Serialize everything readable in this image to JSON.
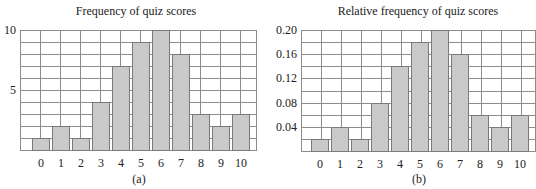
{
  "chart_data": [
    {
      "type": "bar",
      "title": "Frequency of quiz scores",
      "caption": "(a)",
      "xlabel": "",
      "ylabel": "",
      "categories": [
        "0",
        "1",
        "2",
        "3",
        "4",
        "5",
        "6",
        "7",
        "8",
        "9",
        "10"
      ],
      "values": [
        1,
        2,
        1,
        4,
        7,
        9,
        10,
        8,
        3,
        2,
        3
      ],
      "ylim": [
        0,
        10
      ],
      "yticks": [
        5,
        10
      ],
      "ytick_labels": [
        "5",
        "10"
      ],
      "grid_step": 1,
      "grid": true,
      "bar_color": "#c9c9c9"
    },
    {
      "type": "bar",
      "title": "Relative frequency of quiz scores",
      "caption": "(b)",
      "xlabel": "",
      "ylabel": "",
      "categories": [
        "0",
        "1",
        "2",
        "3",
        "4",
        "5",
        "6",
        "7",
        "8",
        "9",
        "10"
      ],
      "values": [
        0.02,
        0.04,
        0.02,
        0.08,
        0.14,
        0.18,
        0.2,
        0.16,
        0.06,
        0.04,
        0.06
      ],
      "ylim": [
        0,
        0.2
      ],
      "yticks": [
        0.04,
        0.08,
        0.12,
        0.16,
        0.2
      ],
      "ytick_labels": [
        "0.04",
        "0.08",
        "0.12",
        "0.16",
        "0.20"
      ],
      "grid_step": 0.02,
      "grid": true,
      "bar_color": "#c9c9c9"
    }
  ]
}
